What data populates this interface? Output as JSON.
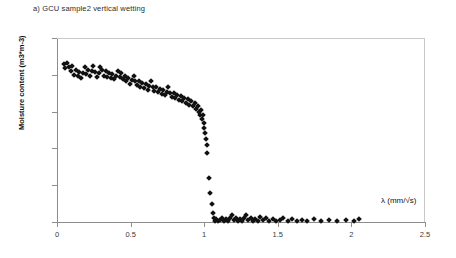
{
  "chart_data": {
    "type": "scatter",
    "title": "a) GCU sample2 vertical wetting",
    "xlabel": "λ  (mm/√s)",
    "ylabel": "Moisture content (m3*m-3)",
    "xlim": [
      0,
      2.5
    ],
    "ylim": [
      0,
      0.25
    ],
    "xticks": [
      "0",
      "0.5",
      "1",
      "1.5",
      "2",
      "2.5"
    ],
    "xtick_values": [
      0,
      0.5,
      1,
      1.5,
      2,
      2.5
    ],
    "yticks": [
      "0",
      "0.05",
      "0.1",
      "0.15",
      "0.2",
      "0.25"
    ],
    "ytick_values": [
      0,
      0.05,
      0.1,
      0.15,
      0.2,
      0.25
    ],
    "grid": false,
    "legend": "none",
    "marker": "diamond",
    "marker_color": "#111111",
    "series": [
      {
        "name": "GCU sample2 vertical wetting",
        "points": [
          [
            0.045,
            0.214
          ],
          [
            0.055,
            0.209
          ],
          [
            0.07,
            0.216
          ],
          [
            0.08,
            0.211
          ],
          [
            0.092,
            0.205
          ],
          [
            0.104,
            0.212
          ],
          [
            0.116,
            0.2
          ],
          [
            0.128,
            0.207
          ],
          [
            0.14,
            0.198
          ],
          [
            0.152,
            0.204
          ],
          [
            0.163,
            0.196
          ],
          [
            0.175,
            0.203
          ],
          [
            0.187,
            0.21
          ],
          [
            0.199,
            0.201
          ],
          [
            0.211,
            0.207
          ],
          [
            0.223,
            0.199
          ],
          [
            0.235,
            0.205
          ],
          [
            0.247,
            0.212
          ],
          [
            0.258,
            0.204
          ],
          [
            0.27,
            0.197
          ],
          [
            0.282,
            0.203
          ],
          [
            0.294,
            0.21
          ],
          [
            0.306,
            0.206
          ],
          [
            0.318,
            0.199
          ],
          [
            0.33,
            0.205
          ],
          [
            0.342,
            0.197
          ],
          [
            0.353,
            0.203
          ],
          [
            0.365,
            0.196
          ],
          [
            0.377,
            0.201
          ],
          [
            0.389,
            0.194
          ],
          [
            0.401,
            0.199
          ],
          [
            0.413,
            0.205
          ],
          [
            0.425,
            0.197
          ],
          [
            0.437,
            0.202
          ],
          [
            0.448,
            0.194
          ],
          [
            0.46,
            0.199
          ],
          [
            0.472,
            0.191
          ],
          [
            0.484,
            0.196
          ],
          [
            0.496,
            0.188
          ],
          [
            0.508,
            0.193
          ],
          [
            0.52,
            0.199
          ],
          [
            0.532,
            0.191
          ],
          [
            0.543,
            0.186
          ],
          [
            0.555,
            0.192
          ],
          [
            0.567,
            0.184
          ],
          [
            0.579,
            0.189
          ],
          [
            0.591,
            0.182
          ],
          [
            0.603,
            0.187
          ],
          [
            0.615,
            0.18
          ],
          [
            0.627,
            0.185
          ],
          [
            0.638,
            0.191
          ],
          [
            0.65,
            0.183
          ],
          [
            0.662,
            0.178
          ],
          [
            0.674,
            0.184
          ],
          [
            0.686,
            0.176
          ],
          [
            0.698,
            0.181
          ],
          [
            0.71,
            0.174
          ],
          [
            0.722,
            0.179
          ],
          [
            0.733,
            0.172
          ],
          [
            0.745,
            0.177
          ],
          [
            0.757,
            0.183
          ],
          [
            0.769,
            0.175
          ],
          [
            0.781,
            0.17
          ],
          [
            0.793,
            0.175
          ],
          [
            0.805,
            0.168
          ],
          [
            0.817,
            0.173
          ],
          [
            0.828,
            0.166
          ],
          [
            0.84,
            0.171
          ],
          [
            0.852,
            0.164
          ],
          [
            0.864,
            0.169
          ],
          [
            0.876,
            0.162
          ],
          [
            0.888,
            0.167
          ],
          [
            0.9,
            0.159
          ],
          [
            0.912,
            0.164
          ],
          [
            0.923,
            0.157
          ],
          [
            0.935,
            0.162
          ],
          [
            0.947,
            0.154
          ],
          [
            0.959,
            0.158
          ],
          [
            0.966,
            0.15
          ],
          [
            0.972,
            0.145
          ],
          [
            0.978,
            0.152
          ],
          [
            0.984,
            0.14
          ],
          [
            0.99,
            0.146
          ],
          [
            0.996,
            0.134
          ],
          [
            1.002,
            0.128
          ],
          [
            1.008,
            0.121
          ],
          [
            1.012,
            0.113
          ],
          [
            1.016,
            0.104
          ],
          [
            1.02,
            0.094
          ],
          [
            1.03,
            0.06
          ],
          [
            1.04,
            0.04
          ],
          [
            1.05,
            0.024
          ],
          [
            1.058,
            0.012
          ],
          [
            1.066,
            0.005
          ],
          [
            1.074,
            0.002
          ],
          [
            1.082,
            0.004
          ],
          [
            1.092,
            0.001
          ],
          [
            1.104,
            0.003
          ],
          [
            1.118,
            0.006
          ],
          [
            1.132,
            0.002
          ],
          [
            1.146,
            0.004
          ],
          [
            1.16,
            0.001
          ],
          [
            1.174,
            0.005
          ],
          [
            1.188,
            0.009
          ],
          [
            1.202,
            0.003
          ],
          [
            1.216,
            0.006
          ],
          [
            1.23,
            0.002
          ],
          [
            1.244,
            0.004
          ],
          [
            1.258,
            0.001
          ],
          [
            1.272,
            0.005
          ],
          [
            1.286,
            0.01
          ],
          [
            1.3,
            0.003
          ],
          [
            1.316,
            0.006
          ],
          [
            1.332,
            0.002
          ],
          [
            1.348,
            0.004
          ],
          [
            1.364,
            0.001
          ],
          [
            1.38,
            0.007
          ],
          [
            1.4,
            0.003
          ],
          [
            1.42,
            0.005
          ],
          [
            1.442,
            0.002
          ],
          [
            1.464,
            0.004
          ],
          [
            1.488,
            0.001
          ],
          [
            1.512,
            0.003
          ],
          [
            1.538,
            0.005
          ],
          [
            1.566,
            0.002
          ],
          [
            1.596,
            0.004
          ],
          [
            1.628,
            0.001
          ],
          [
            1.662,
            0.003
          ],
          [
            1.7,
            0.002
          ],
          [
            1.745,
            0.004
          ],
          [
            1.792,
            0.001
          ],
          [
            1.845,
            0.003
          ],
          [
            1.9,
            0.002
          ],
          [
            1.96,
            0.003
          ],
          [
            2.02,
            0.002
          ],
          [
            2.05,
            0.004
          ]
        ]
      }
    ]
  }
}
